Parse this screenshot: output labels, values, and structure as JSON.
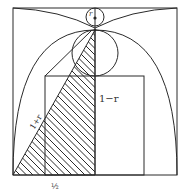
{
  "figure": {
    "labels": {
      "small_circle": "r",
      "vertical_segment": "1−r",
      "hypotenuse": "1+r",
      "base": "½"
    },
    "colors": {
      "line": "#2a2a2a",
      "background": "#ffffff"
    }
  }
}
